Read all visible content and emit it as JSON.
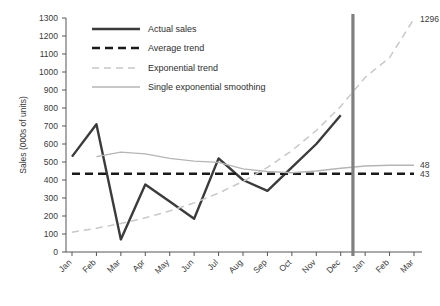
{
  "chart_data": {
    "type": "line",
    "title": "",
    "xlabel": "",
    "ylabel": "Sales (000s of units)",
    "ylim": [
      0,
      1300
    ],
    "ytick_step": 100,
    "yticks": [
      "0",
      "100",
      "200",
      "300",
      "400",
      "500",
      "600",
      "700",
      "800",
      "900",
      "1000",
      "1100",
      "1200",
      "1300"
    ],
    "categories": [
      "Jan",
      "Feb",
      "Mar",
      "Apr",
      "May",
      "Jun",
      "Jul",
      "Aug",
      "Sep",
      "Oct",
      "Nov",
      "Dec",
      "Jan",
      "Feb",
      "Mar"
    ],
    "grid": false,
    "legend_position": "top-center",
    "series": [
      {
        "name": "Actual sales",
        "style": "solid-thick",
        "color": "#3b3b3b",
        "values": [
          530,
          710,
          70,
          375,
          280,
          185,
          520,
          400,
          340,
          470,
          600,
          760,
          null,
          null,
          null
        ]
      },
      {
        "name": "Average trend",
        "style": "dashed-thick",
        "color": "#1a1a1a",
        "values": [
          435,
          435,
          435,
          435,
          435,
          435,
          435,
          435,
          435,
          435,
          435,
          435,
          435,
          435,
          435
        ]
      },
      {
        "name": "Exponential trend",
        "style": "dashed-thin",
        "color": "#c8c8c8",
        "values": [
          110,
          132,
          158,
          190,
          228,
          273,
          327,
          392,
          470,
          563,
          675,
          809,
          970,
          1080,
          1296
        ]
      },
      {
        "name": "Single exponential smoothing",
        "style": "solid-thin",
        "color": "#b5b5b5",
        "values": [
          null,
          530,
          555,
          545,
          520,
          505,
          498,
          462,
          447,
          440,
          450,
          465,
          478,
          482,
          482
        ]
      }
    ],
    "annotations": [
      {
        "name": "exponential-trend-endpoint",
        "text": "1296",
        "series": "Exponential trend",
        "value": 1296,
        "at": "Mar"
      },
      {
        "name": "smoothing-endpoint",
        "text": "48",
        "series": "Single exponential smoothing",
        "value": 482,
        "at": "Mar"
      },
      {
        "name": "average-trend-endpoint",
        "text": "43",
        "series": "Average trend",
        "value": 435,
        "at": "Mar"
      }
    ],
    "divider": {
      "name": "forecast-divider",
      "after_category": "Dec",
      "color": "#808080"
    }
  },
  "legend": {
    "items": [
      {
        "label": "Actual sales",
        "key": "actual-sales"
      },
      {
        "label": "Average trend",
        "key": "average-trend"
      },
      {
        "label": "Exponential trend",
        "key": "exponential-trend"
      },
      {
        "label": "Single exponential smoothing",
        "key": "single-exponential-smoothing"
      }
    ]
  },
  "axis": {
    "y_title": "Sales (000s of units)"
  }
}
